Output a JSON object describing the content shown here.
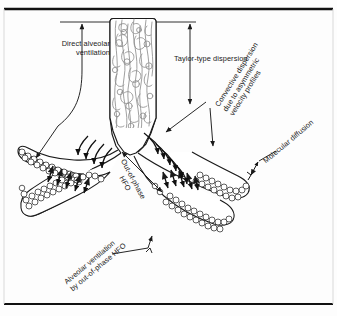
{
  "figure": {
    "border_color": "#111111",
    "ink_color": "#1a1a1a",
    "airway_fill": "#ffffff",
    "alveoli_fill": "#f2f2f2"
  },
  "labels": {
    "direct_alveolar_ventilation": "Direct alveolar\nventilation",
    "taylor_type_dispersion": "Taylor-type dispersion",
    "convective_dispersion": "Convective dispersion\ndue to asymmetric\nvelocity profiles",
    "molecular_diffusion": "Molecular diffusion",
    "out_of_phase_hfo": "Out-of-phase\nHFO",
    "alveolar_ventilation_by_out_of_phase_hfo": "Alveolar ventilation\nby out-of-phase HFO"
  },
  "annotations": {
    "reference_line_label": "airway-opening reference line",
    "arrow_count_left_duct": 5,
    "arrow_count_right_duct": 5
  }
}
